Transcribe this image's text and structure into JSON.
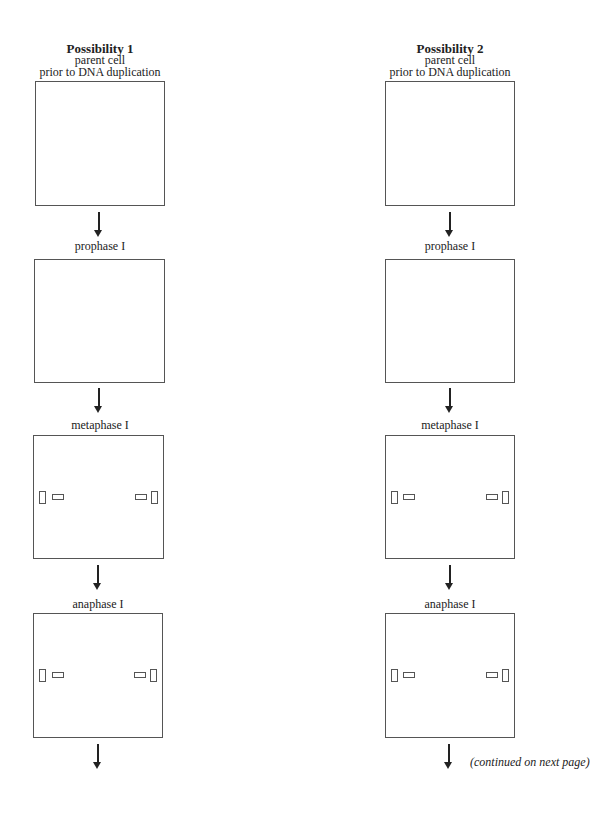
{
  "columns": [
    {
      "title": "Possibility 1",
      "subtitle_line1": "parent cell",
      "subtitle_line2": "prior to DNA duplication",
      "stages": [
        "prophase I",
        "metaphase I",
        "anaphase I"
      ]
    },
    {
      "title": "Possibility 2",
      "subtitle_line1": "parent cell",
      "subtitle_line2": "prior to DNA duplication",
      "stages": [
        "prophase I",
        "metaphase I",
        "anaphase I"
      ]
    }
  ],
  "footer": {
    "continued_note": "(continued on next page)"
  },
  "colors": {
    "line": "#555555",
    "text": "#222222",
    "background": "#ffffff"
  }
}
